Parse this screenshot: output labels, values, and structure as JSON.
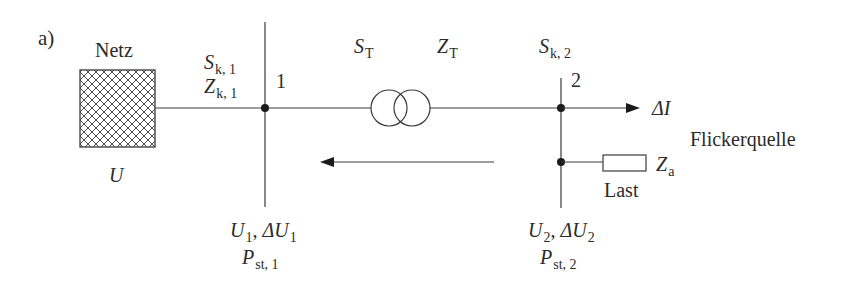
{
  "figure": {
    "panel_label": "a)",
    "colors": {
      "line": "#3a3a3a",
      "text": "#2b2b2b",
      "background": "#ffffff"
    }
  },
  "grid_source": {
    "title": "Netz",
    "voltage_symbol": "U",
    "icon": "hatched-square-icon"
  },
  "bus1": {
    "number": "1",
    "short_circuit_power": {
      "symbol": "S",
      "sub": "k, 1"
    },
    "short_circuit_impedance": {
      "symbol": "Z",
      "sub": "k, 1"
    },
    "voltage": {
      "symbol": "U",
      "sub": "1",
      "sep": ", ",
      "delta": "ΔU",
      "delta_sub": "1"
    },
    "flicker": {
      "symbol": "P",
      "sub": "st, 1"
    }
  },
  "transformer": {
    "power": {
      "symbol": "S",
      "sub": "T"
    },
    "impedance": {
      "symbol": "Z",
      "sub": "T"
    },
    "icon": "transformer-icon"
  },
  "bus2": {
    "number": "2",
    "short_circuit_power": {
      "symbol": "S",
      "sub": "k, 2"
    },
    "voltage": {
      "symbol": "U",
      "sub": "2",
      "sep": ", ",
      "delta": "ΔU",
      "delta_sub": "2"
    },
    "flicker": {
      "symbol": "P",
      "sub": "st, 2"
    }
  },
  "current_change": {
    "symbol": "ΔI"
  },
  "flicker_source": {
    "label": "Flickerquelle"
  },
  "load": {
    "label": "Last",
    "impedance": {
      "symbol": "Z",
      "sub": "a"
    },
    "icon": "resistor-icon"
  }
}
